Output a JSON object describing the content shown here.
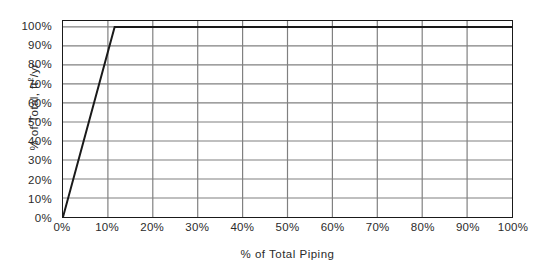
{
  "chart_data": {
    "type": "line",
    "title": "",
    "xlabel": "% of Total Piping",
    "ylabel_text": "% of Total,  ft",
    "ylabel_sup": "2",
    "ylabel_tail": "/yr",
    "ylabel_full": "% of Total, ft2/yr",
    "xlim": [
      0,
      100
    ],
    "ylim": [
      0,
      100
    ],
    "x_ticks": [
      0,
      10,
      20,
      30,
      40,
      50,
      60,
      70,
      80,
      90,
      100
    ],
    "x_tick_labels": [
      "0%",
      "10%",
      "20%",
      "30%",
      "40%",
      "50%",
      "60%",
      "70%",
      "80%",
      "90%",
      "100%"
    ],
    "y_ticks": [
      0,
      10,
      20,
      30,
      40,
      50,
      60,
      70,
      80,
      90,
      100
    ],
    "y_tick_labels": [
      "0%",
      "10%",
      "20%",
      "30%",
      "40%",
      "50%",
      "60%",
      "70%",
      "80%",
      "90%",
      "100%"
    ],
    "grid": true,
    "grid_color": "#808080",
    "frame_color": "#1a1a1a",
    "background": "#ffffff",
    "legend": null,
    "series": [
      {
        "name": "Cumulative distribution",
        "color": "#1a1a1a",
        "line_width": 2,
        "x": [
          0,
          11.5,
          100
        ],
        "y": [
          0,
          100,
          100
        ]
      }
    ]
  }
}
